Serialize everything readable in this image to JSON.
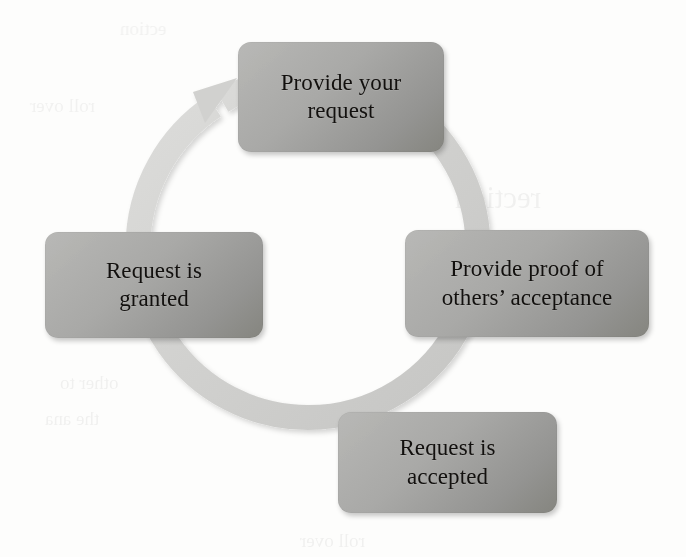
{
  "diagram": {
    "type": "cycle",
    "title": "",
    "direction": "clockwise",
    "shape": "circular-arrow",
    "arrow_color": "#d2d2d0",
    "node_color": "#a2a2a0",
    "node_text_color": "#13110f",
    "background_color": "#fdfdfc",
    "node_count": 4,
    "nodes": [
      {
        "id": "provide-request",
        "position": "top",
        "order": 1,
        "lines": [
          "Provide your",
          "request"
        ],
        "text": "Provide your request"
      },
      {
        "id": "provide-proof",
        "position": "right",
        "order": 2,
        "lines": [
          "Provide proof of",
          "others’ acceptance"
        ],
        "text": "Provide proof of others’ acceptance"
      },
      {
        "id": "request-accepted",
        "position": "bottom",
        "order": 3,
        "lines": [
          "Request is",
          "accepted"
        ],
        "text": "Request is accepted"
      },
      {
        "id": "request-granted",
        "position": "left",
        "order": 4,
        "lines": [
          "Request is",
          "granted"
        ],
        "text": "Request is granted"
      }
    ],
    "arrowhead": {
      "position": "top-left",
      "points_to": "provide-request"
    }
  },
  "page_artifacts": {
    "note": "faint mirrored bleed-through text from the reverse page",
    "ghost_lines": [
      "rection",
      "ection",
      "roll over",
      "other to",
      "the ana"
    ]
  }
}
